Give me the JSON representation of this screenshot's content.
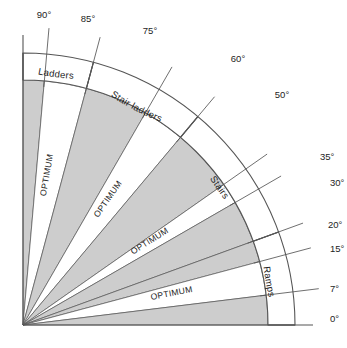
{
  "diagram": {
    "background_color": "#ffffff",
    "line_color": "#555555",
    "wedge_fill_gray": "#cdcdcd",
    "wedge_fill_white": "#ffffff",
    "text_color": "#1d1d1d",
    "geometry": {
      "origin_x": 23,
      "origin_y": 325,
      "outer_radius": 272,
      "inner_radius": 245
    },
    "axis_labels": {
      "vertical_top": "90°",
      "horizontal_right": "0°"
    },
    "ticks": [
      {
        "label": "90°",
        "angle": 90
      },
      {
        "label": "85°",
        "angle": 85
      },
      {
        "label": "75°",
        "angle": 75
      },
      {
        "label": "60°",
        "angle": 60
      },
      {
        "label": "50°",
        "angle": 50
      },
      {
        "label": "35°",
        "angle": 35
      },
      {
        "label": "30°",
        "angle": 30
      },
      {
        "label": "20°",
        "angle": 20
      },
      {
        "label": "15°",
        "angle": 15
      },
      {
        "label": "7°",
        "angle": 7
      },
      {
        "label": "0°",
        "angle": 0
      }
    ],
    "bands": [
      {
        "name": "Ladders",
        "label": "Ladders",
        "start_angle": 75,
        "end_angle": 90
      },
      {
        "name": "Stair ladders",
        "label": "Stair ladders",
        "start_angle": 50,
        "end_angle": 75
      },
      {
        "name": "Stairs",
        "label": "Stairs",
        "start_angle": 20,
        "end_angle": 50
      },
      {
        "name": "Ramps",
        "label": "Ramps",
        "start_angle": 0,
        "end_angle": 20
      }
    ],
    "optimum_label": "OPTIMUM",
    "wedges": [
      {
        "start_angle": 85,
        "end_angle": 90,
        "fill": "gray",
        "label": ""
      },
      {
        "start_angle": 75,
        "end_angle": 85,
        "fill": "white",
        "label": "OPTIMUM"
      },
      {
        "start_angle": 60,
        "end_angle": 75,
        "fill": "gray",
        "label": ""
      },
      {
        "start_angle": 50,
        "end_angle": 60,
        "fill": "white",
        "label": "OPTIMUM"
      },
      {
        "start_angle": 35,
        "end_angle": 50,
        "fill": "gray",
        "label": ""
      },
      {
        "start_angle": 30,
        "end_angle": 35,
        "fill": "white",
        "label": "OPTIMUM"
      },
      {
        "start_angle": 20,
        "end_angle": 30,
        "fill": "gray",
        "label": ""
      },
      {
        "start_angle": 15,
        "end_angle": 20,
        "fill": "gray",
        "label": ""
      },
      {
        "start_angle": 7,
        "end_angle": 15,
        "fill": "white",
        "label": "OPTIMUM"
      },
      {
        "start_angle": 0,
        "end_angle": 7,
        "fill": "gray",
        "label": ""
      }
    ]
  }
}
